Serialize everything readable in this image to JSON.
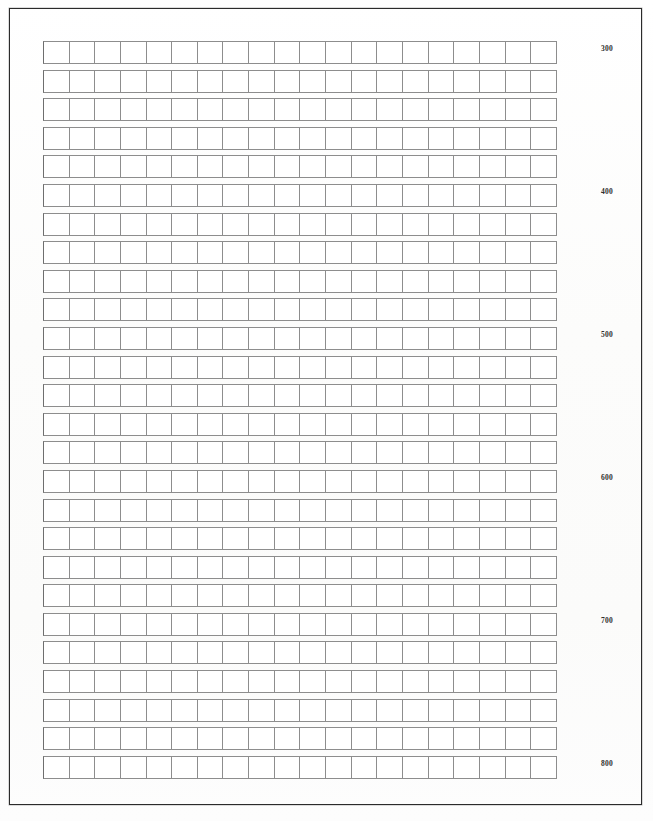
{
  "document": {
    "kind": "blank-tally-grid-form",
    "paper_color": "#fdfdfc",
    "frame_color": "#2b2b2b",
    "cell_border_color": "#8d8d8d",
    "label_color": "#2e2e2e"
  },
  "grid": {
    "columns": 20,
    "rows": 26,
    "cell_width_px": 27,
    "cell_height_px": 23,
    "row_pitch_px": 28.6,
    "label_interval_rows": 5
  },
  "row_labels": [
    "300",
    "",
    "",
    "",
    "",
    "400",
    "",
    "",
    "",
    "",
    "500",
    "",
    "",
    "",
    "",
    "600",
    "",
    "",
    "",
    "",
    "700",
    "",
    "",
    "",
    "",
    "800"
  ],
  "visible_labels": [
    "300",
    "400",
    "500",
    "600",
    "700",
    "800"
  ]
}
